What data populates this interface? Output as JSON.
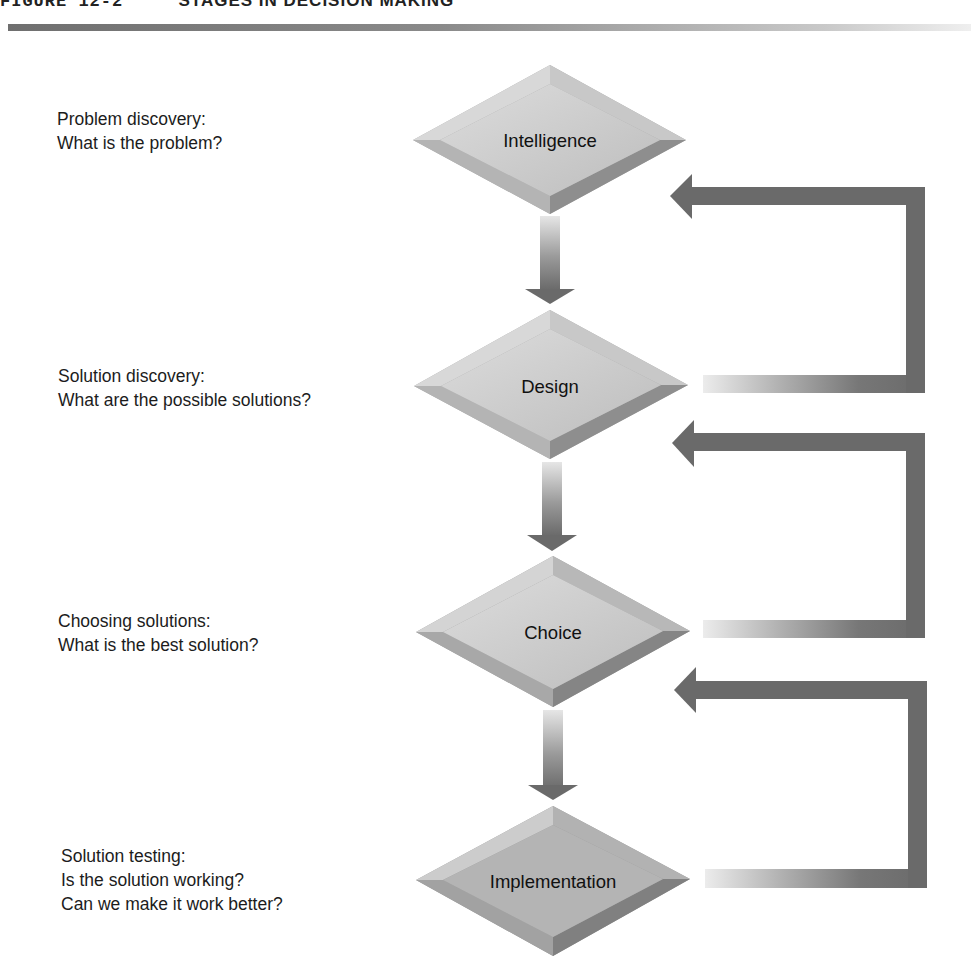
{
  "figure": {
    "number": "FIGURE 12-2",
    "title": "STAGES IN DECISION MAKING"
  },
  "stages": [
    {
      "name": "Intelligence",
      "label_lines": [
        "Problem discovery:",
        "What is the problem?"
      ]
    },
    {
      "name": "Design",
      "label_lines": [
        "Solution discovery:",
        "What are the possible solutions?"
      ]
    },
    {
      "name": "Choice",
      "label_lines": [
        "Choosing solutions:",
        "What is the best solution?"
      ]
    },
    {
      "name": "Implementation",
      "label_lines": [
        "Solution testing:",
        "Is the solution working?",
        "Can we make it work better?"
      ]
    }
  ],
  "colors": {
    "diamond_face": "#c9c9c9",
    "diamond_bevel_light": "#dedede",
    "diamond_bevel_dark": "#8e8e8e",
    "arrow_dark": "#6a6a6a",
    "arrow_light": "#e4e4e4"
  }
}
